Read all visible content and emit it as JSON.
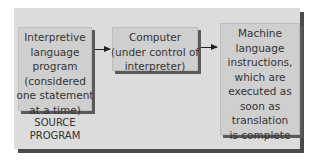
{
  "diagram": {
    "nodes": [
      {
        "id": "source-program",
        "lines": [
          "Interpretive",
          "language",
          "program",
          "(considered",
          "one statement",
          "at a time)"
        ]
      },
      {
        "id": "computer",
        "lines": [
          "Computer",
          "(under control of",
          "interpreter)"
        ]
      },
      {
        "id": "machine-language",
        "lines": [
          "Machine",
          "language",
          "instructions,",
          "which are",
          "executed as",
          "soon as",
          "translation",
          "is complete"
        ]
      }
    ],
    "caption": [
      "SOURCE",
      "PROGRAM"
    ],
    "edges": [
      {
        "from": "source-program",
        "to": "computer"
      },
      {
        "from": "computer",
        "to": "machine-language"
      }
    ],
    "colors": {
      "panel": "#dcdcdc",
      "box": "#cfcfcf",
      "shadow": "#4a4a4a",
      "text": "#333333"
    }
  }
}
